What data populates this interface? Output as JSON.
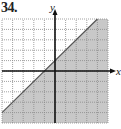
{
  "problem": {
    "number": "34."
  },
  "chart_data": {
    "type": "inequality-graph",
    "title": "34.",
    "xlabel": "x",
    "ylabel": "y",
    "xlim": [
      -5,
      5
    ],
    "ylim": [
      -5,
      5
    ],
    "grid": true,
    "grid_step": 1,
    "boundary": {
      "equation": "y = x + 1",
      "slope": 1,
      "intercept": 1,
      "style": "solid"
    },
    "inequality": "y <= x + 1",
    "shaded_region": "below boundary line",
    "colors": {
      "shade": "#c8c8c8",
      "grid": "#8a8a8a",
      "axes": "#111111",
      "line": "#555555"
    }
  },
  "axes": {
    "x_label": "x",
    "y_label": "y"
  }
}
